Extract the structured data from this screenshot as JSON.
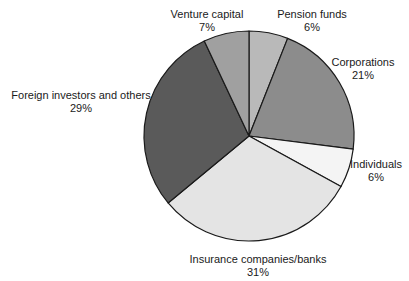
{
  "chart_data": {
    "type": "pie",
    "title": "",
    "start_angle_deg": 0,
    "direction": "clockwise",
    "center": [
      249,
      136
    ],
    "radius": 105,
    "slices": [
      {
        "label": "Pension funds",
        "value": 6,
        "pct_label": "6%",
        "color": "#b9b9b9",
        "label_pos": [
          312,
          8
        ]
      },
      {
        "label": "Corporations",
        "value": 21,
        "pct_label": "21%",
        "color": "#8c8c8c",
        "label_pos": [
          363,
          56
        ]
      },
      {
        "label": "Individuals",
        "value": 6,
        "pct_label": "6%",
        "color": "#f4f4f4",
        "label_pos": [
          376,
          158
        ]
      },
      {
        "label": "Insurance companies/banks",
        "value": 31,
        "pct_label": "31%",
        "color": "#e4e4e4",
        "label_pos": [
          258,
          253
        ]
      },
      {
        "label": "Foreign investors and others",
        "value": 29,
        "pct_label": "29%",
        "color": "#5a5a5a",
        "label_pos": [
          81,
          89
        ]
      },
      {
        "label": "Venture capital",
        "value": 7,
        "pct_label": "7%",
        "color": "#a0a0a0",
        "label_pos": [
          207,
          8
        ]
      }
    ],
    "stroke_color": "#1a1a1a"
  }
}
